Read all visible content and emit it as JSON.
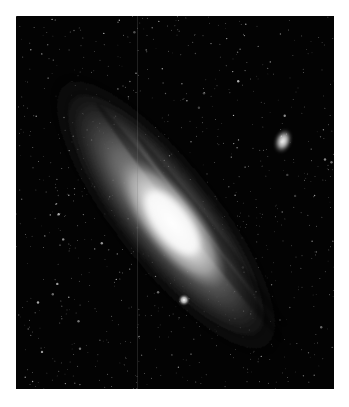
{
  "image": {
    "subject": "Andromeda Galaxy",
    "alt": "Black-and-white astronomical photograph of a large spiral galaxy seen at a steep angle, with two small companion galaxies and a dense star field",
    "palette": {
      "background": "#030303",
      "page": "#ffffff",
      "core": "#f2f2f2",
      "disk": "#8a8a8a",
      "outer_halo": "#3a3a3a",
      "star": "#d8d8d8"
    },
    "features": [
      {
        "name": "main-galaxy",
        "center": [
          166,
          215
        ],
        "tilt_deg": 42
      },
      {
        "name": "companion-galaxy-upper-right",
        "center": [
          283,
          141
        ]
      },
      {
        "name": "companion-galaxy-lower-center",
        "center": [
          184,
          300
        ]
      }
    ]
  }
}
